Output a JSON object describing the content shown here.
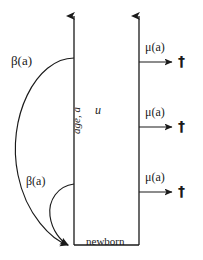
{
  "figure": {
    "background_color": "#ffffff",
    "ink_color": "#1a1a1a"
  },
  "axes": {
    "age_axis_label": "age, a",
    "density_label": "u",
    "newborn_label": "newborn"
  },
  "birth_flux": {
    "label_large": "β(a)",
    "label_small": "β(a)"
  },
  "mortality_flux": {
    "arrows": [
      {
        "label": "μ(a)",
        "marker": "†"
      },
      {
        "label": "μ(a)",
        "marker": "†"
      },
      {
        "label": "μ(a)",
        "marker": "†"
      }
    ]
  },
  "icons": {
    "grave_cross": "†",
    "arrow_up": "arrow-up-icon",
    "arrow_right": "arrow-right-icon"
  }
}
